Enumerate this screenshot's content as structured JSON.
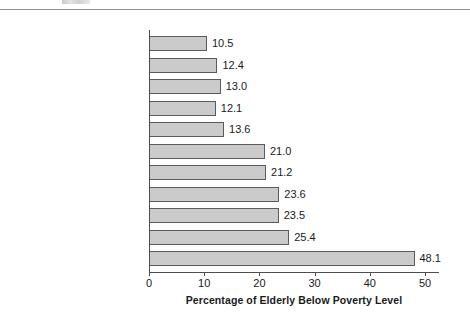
{
  "chart_data": {
    "type": "bar",
    "orientation": "horizontal",
    "title": "",
    "xlabel": "Percentage of Elderly Below Poverty Level",
    "ylabel": "",
    "xlim": [
      0,
      52.5
    ],
    "xticks": [
      0,
      10,
      20,
      30,
      40,
      50
    ],
    "xtick_labels": [
      "0",
      "10",
      "20",
      "30",
      "40",
      "50"
    ],
    "grid": false,
    "legend": false,
    "bar_fill_color": "#cbcbcb",
    "bar_edge_color": "#5a5a5a",
    "axis_color": "#4d4d4d",
    "categories": [
      "All people",
      "Central city",
      "All people 75+",
      "Nonmetropolitan",
      "Women",
      "Not completed H.S.",
      "Living alone",
      "Women living alone",
      "Hispanics",
      "Black",
      "Black women living alone"
    ],
    "values": [
      10.5,
      12.4,
      13.0,
      12.1,
      13.6,
      21.0,
      21.2,
      23.6,
      23.5,
      25.4,
      48.1
    ],
    "value_labels": [
      "10.5",
      "12.4",
      "13.0",
      "12.1",
      "13.6",
      "21.0",
      "21.2",
      "23.6",
      "23.5",
      "25.4",
      "48.1"
    ]
  }
}
